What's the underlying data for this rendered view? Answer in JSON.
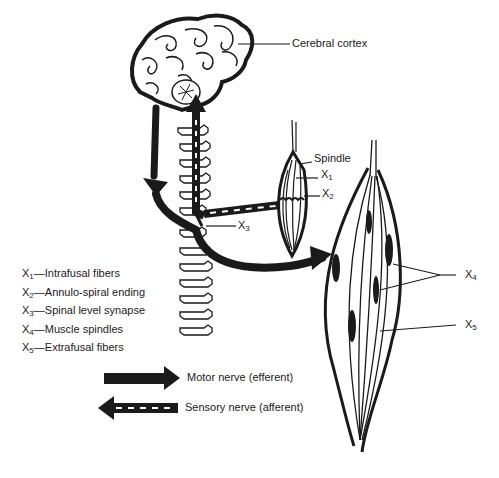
{
  "diagram": {
    "title_labels": {
      "cerebral_cortex": "Cerebral cortex",
      "spindle": "Spindle"
    },
    "markers": [
      {
        "id": "X1",
        "letter": "X",
        "sub": "1"
      },
      {
        "id": "X2",
        "letter": "X",
        "sub": "2"
      },
      {
        "id": "X3",
        "letter": "X",
        "sub": "3"
      },
      {
        "id": "X4",
        "letter": "X",
        "sub": "4"
      },
      {
        "id": "X5",
        "letter": "X",
        "sub": "5"
      }
    ],
    "key": [
      {
        "letter": "X",
        "sub": "1",
        "text": "—Intrafusal fibers"
      },
      {
        "letter": "X",
        "sub": "2",
        "text": "—Annulo-spiral ending"
      },
      {
        "letter": "X",
        "sub": "3",
        "text": "—Spinal level synapse"
      },
      {
        "letter": "X",
        "sub": "4",
        "text": "—Muscle spindles"
      },
      {
        "letter": "X",
        "sub": "5",
        "text": "—Extrafusal fibers"
      }
    ],
    "arrow_legend": [
      {
        "style": "solid",
        "label": "Motor nerve (efferent)"
      },
      {
        "style": "dashed",
        "label": "Sensory nerve (afferent)"
      }
    ],
    "colors": {
      "ink": "#1a1a1a",
      "background": "#ffffff"
    }
  }
}
